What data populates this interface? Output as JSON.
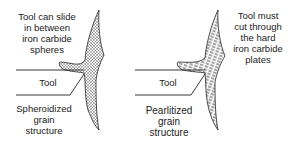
{
  "left_panel": {
    "annotation": "Tool can slide\nin between\niron carbide\nspheres",
    "tool_label": "Tool",
    "structure_label": "Spheroidized\ngrain\nstructure"
  },
  "right_panel": {
    "annotation": "Tool must\ncut through\nthe hard\niron carbide\nplates",
    "tool_label": "Tool",
    "structure_label": "Pearlitized\ngrain\nstructure"
  }
}
